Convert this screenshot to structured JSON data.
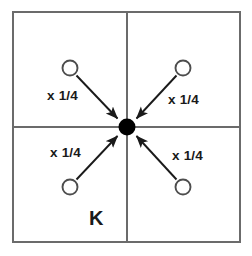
{
  "figure": {
    "type": "diagram",
    "title": "K",
    "canvas": {
      "width": 252,
      "height": 256,
      "background": "#ffffff"
    },
    "colors": {
      "frame": "#6b6b6b",
      "divider": "#6b6b6b",
      "arrow": "#1a1a1a",
      "node_stroke": "#4d4d4d",
      "node_fill": "#ffffff",
      "center_fill": "#000000",
      "text": "#1a1a1a"
    },
    "frame": {
      "x": 13,
      "y": 12,
      "width": 227,
      "height": 230,
      "stroke_width": 2
    },
    "dividers": {
      "vertical_x": 127,
      "horizontal_y": 127,
      "stroke_width": 2
    },
    "center_node": {
      "name": "center-node",
      "cx": 127,
      "cy": 127,
      "r": 8.5,
      "filled": true
    },
    "nodes": [
      {
        "name": "node-top-left",
        "quadrant": "top-left",
        "cx": 70,
        "cy": 68,
        "r": 7.5
      },
      {
        "name": "node-top-right",
        "quadrant": "top-right",
        "cx": 183,
        "cy": 68,
        "r": 7.5
      },
      {
        "name": "node-bottom-left",
        "quadrant": "bottom-left",
        "cx": 70,
        "cy": 187,
        "r": 7.5
      },
      {
        "name": "node-bottom-right",
        "quadrant": "bottom-right",
        "cx": 183,
        "cy": 187,
        "r": 7.5
      }
    ],
    "arrows": [
      {
        "name": "arrow-top-left-to-center",
        "from": "node-top-left",
        "to": "center-node",
        "direction": "into-center"
      },
      {
        "name": "arrow-top-right-to-center",
        "from": "node-top-right",
        "to": "center-node",
        "direction": "into-center"
      },
      {
        "name": "arrow-bottom-left-to-center",
        "from": "node-bottom-left",
        "to": "center-node",
        "direction": "into-center"
      },
      {
        "name": "arrow-bottom-right-to-center",
        "from": "node-bottom-right",
        "to": "center-node",
        "direction": "into-center"
      }
    ],
    "weight_labels": [
      {
        "name": "weight-label-top-left",
        "text": "x 1/4",
        "x": 47,
        "y": 100
      },
      {
        "name": "weight-label-top-right",
        "text": "x 1/4",
        "x": 168,
        "y": 104
      },
      {
        "name": "weight-label-bottom-left",
        "text": "x 1/4",
        "x": 50,
        "y": 157
      },
      {
        "name": "weight-label-bottom-right",
        "text": "x 1/4",
        "x": 172,
        "y": 160
      }
    ],
    "kernel_label": {
      "name": "kernel-label",
      "text": "K",
      "x": 89,
      "y": 225
    }
  }
}
